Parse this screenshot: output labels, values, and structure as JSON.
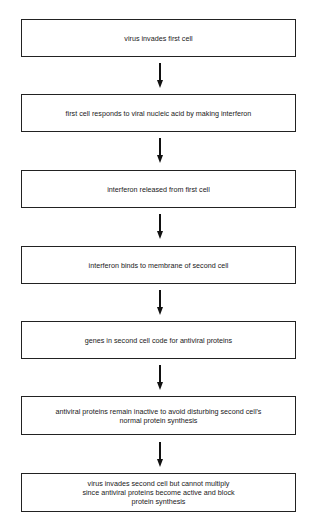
{
  "diagram": {
    "type": "flowchart",
    "direction": "top-to-bottom",
    "steps": [
      {
        "label": "virus invades first cell"
      },
      {
        "label": "first cell responds to viral nucleic acid by making interferon"
      },
      {
        "label": "interferon released from first cell"
      },
      {
        "label": "interferon binds to membrane of second cell"
      },
      {
        "label": "genes in second cell code for antiviral proteins"
      },
      {
        "label": "antiviral proteins remain inactive to avoid disturbing second cell's normal protein synthesis"
      },
      {
        "label": "virus invades second cell but cannot multiply since antiviral proteins become active and block protein synthesis"
      }
    ],
    "connectors": [
      {
        "from": 0,
        "to": 1,
        "icon": "down-arrow-icon"
      },
      {
        "from": 1,
        "to": 2,
        "icon": "down-arrow-icon"
      },
      {
        "from": 2,
        "to": 3,
        "icon": "down-arrow-icon"
      },
      {
        "from": 3,
        "to": 4,
        "icon": "down-arrow-icon"
      },
      {
        "from": 4,
        "to": 5,
        "icon": "down-arrow-icon"
      },
      {
        "from": 5,
        "to": 6,
        "icon": "down-arrow-icon"
      }
    ]
  }
}
